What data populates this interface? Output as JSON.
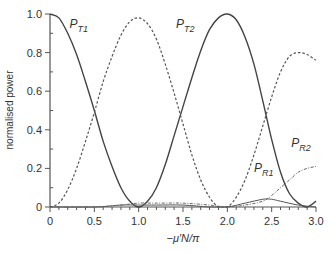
{
  "chart_data": {
    "type": "line",
    "title": "",
    "xlabel": "−μ′N/π",
    "ylabel": "normalised power",
    "xlim": [
      0,
      3.0
    ],
    "ylim": [
      0,
      1.0
    ],
    "x_ticks": [
      "0",
      "0.5",
      "1.0",
      "1.5",
      "2.0",
      "2.5",
      "3.0"
    ],
    "y_ticks": [
      "0",
      "0.2",
      "0.4",
      "0.6",
      "0.8",
      "1.0"
    ],
    "grid": false,
    "legend": "inline labels",
    "series": [
      {
        "name": "P_T1",
        "style": "solid",
        "x": [
          0,
          0.1,
          0.2,
          0.3,
          0.4,
          0.5,
          0.6,
          0.7,
          0.8,
          0.9,
          1.0,
          1.1,
          1.2,
          1.3,
          1.4,
          1.5,
          1.6,
          1.7,
          1.8,
          1.9,
          2.0,
          2.1,
          2.2,
          2.3,
          2.4,
          2.5,
          2.6,
          2.7,
          2.8,
          2.9,
          3.0
        ],
        "y": [
          1.0,
          0.98,
          0.9,
          0.79,
          0.65,
          0.5,
          0.34,
          0.21,
          0.1,
          0.03,
          0.0,
          0.03,
          0.1,
          0.22,
          0.37,
          0.52,
          0.67,
          0.81,
          0.92,
          0.98,
          1.0,
          0.97,
          0.88,
          0.74,
          0.55,
          0.35,
          0.18,
          0.07,
          0.02,
          0.0,
          0.03
        ]
      },
      {
        "name": "P_T2",
        "style": "dashed",
        "x": [
          0,
          0.1,
          0.2,
          0.3,
          0.4,
          0.5,
          0.6,
          0.7,
          0.8,
          0.9,
          1.0,
          1.1,
          1.2,
          1.3,
          1.4,
          1.5,
          1.6,
          1.7,
          1.8,
          1.9,
          2.0,
          2.1,
          2.2,
          2.3,
          2.4,
          2.5,
          2.6,
          2.7,
          2.8,
          2.9,
          3.0
        ],
        "y": [
          0.0,
          0.02,
          0.09,
          0.2,
          0.34,
          0.49,
          0.65,
          0.78,
          0.89,
          0.96,
          0.98,
          0.95,
          0.87,
          0.74,
          0.59,
          0.43,
          0.27,
          0.14,
          0.05,
          0.0,
          0.0,
          0.05,
          0.14,
          0.27,
          0.42,
          0.57,
          0.7,
          0.78,
          0.8,
          0.79,
          0.76
        ]
      },
      {
        "name": "P_R1",
        "style": "solid-thin",
        "x": [
          0,
          0.5,
          0.8,
          1.0,
          1.2,
          1.5,
          1.8,
          2.0,
          2.2,
          2.4,
          2.5,
          2.6,
          2.8,
          3.0
        ],
        "y": [
          0.0,
          0.0,
          0.01,
          0.01,
          0.01,
          0.01,
          0.0,
          0.0,
          0.02,
          0.04,
          0.04,
          0.03,
          0.01,
          0.0
        ]
      },
      {
        "name": "P_R2",
        "style": "dash-dot",
        "x": [
          0,
          0.5,
          0.8,
          1.0,
          1.2,
          1.5,
          1.8,
          2.0,
          2.2,
          2.4,
          2.5,
          2.6,
          2.7,
          2.8,
          2.9,
          3.0
        ],
        "y": [
          0.0,
          0.0,
          0.01,
          0.02,
          0.02,
          0.02,
          0.01,
          0.0,
          0.01,
          0.03,
          0.06,
          0.1,
          0.14,
          0.18,
          0.2,
          0.21
        ]
      }
    ],
    "annotations": [
      {
        "text": "P",
        "sub": "T1",
        "x": 0.22,
        "y": 0.93
      },
      {
        "text": "P",
        "sub": "T2",
        "x": 1.42,
        "y": 0.93
      },
      {
        "text": "P",
        "sub": "R1",
        "x": 2.3,
        "y": 0.18
      },
      {
        "text": "P",
        "sub": "R2",
        "x": 2.72,
        "y": 0.31
      }
    ]
  }
}
